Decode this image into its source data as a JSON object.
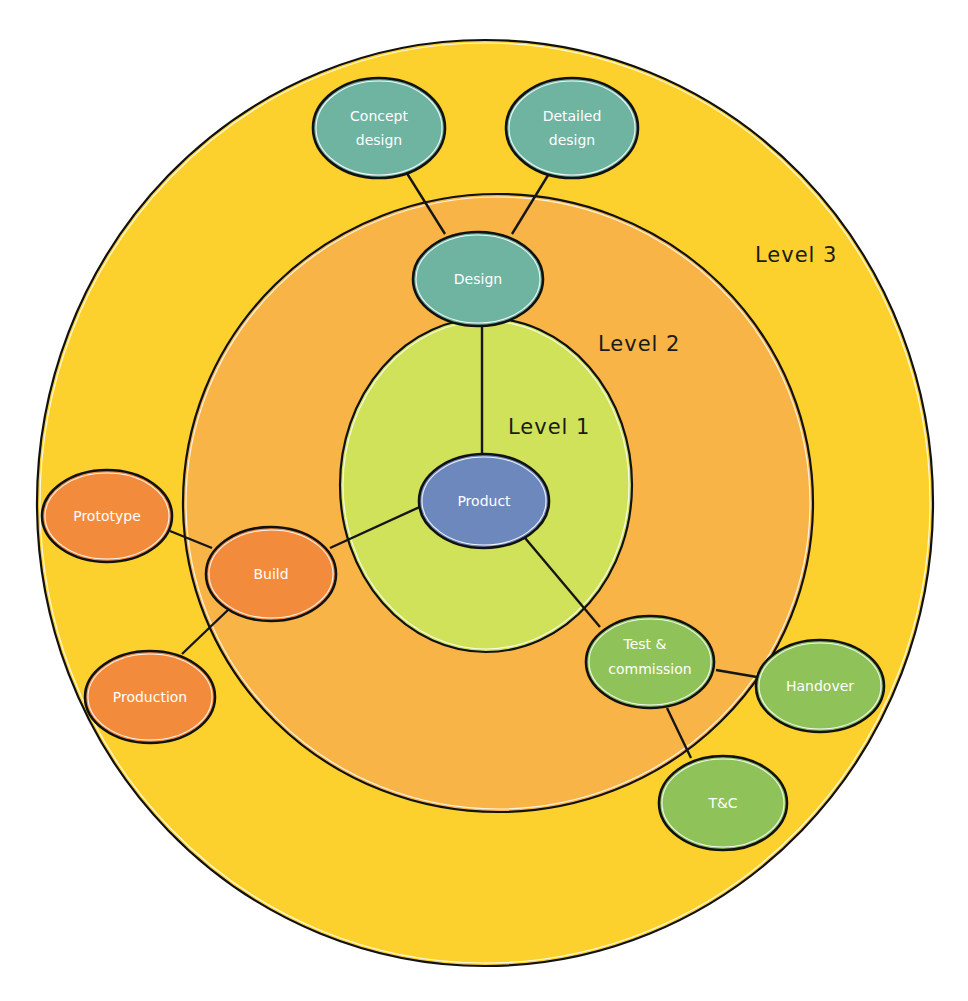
{
  "diagram": {
    "colors": {
      "background": "#ffffff",
      "level3_fill": "#fcd12e",
      "level2_fill": "#f8b446",
      "level1_fill": "#cfe25a",
      "outline": "#111111",
      "teal_node": "#6fb3a1",
      "orange_node": "#f38b3c",
      "green_node": "#8fc35a",
      "blue_node": "#6d88bd",
      "label_text": "#ffffff"
    },
    "levels": [
      {
        "id": "level3",
        "label": "Level 3"
      },
      {
        "id": "level2",
        "label": "Level 2"
      },
      {
        "id": "level1",
        "label": "Level 1"
      }
    ],
    "nodes": {
      "product": {
        "lines": [
          "Product"
        ]
      },
      "design": {
        "lines": [
          "Design"
        ]
      },
      "concept_design": {
        "lines": [
          "Concept",
          "design"
        ]
      },
      "detailed_design": {
        "lines": [
          "Detailed",
          "design"
        ]
      },
      "build": {
        "lines": [
          "Build"
        ]
      },
      "prototype": {
        "lines": [
          "Prototype"
        ]
      },
      "production": {
        "lines": [
          "Production"
        ]
      },
      "test_commission": {
        "lines": [
          "Test &",
          "commission"
        ]
      },
      "handover": {
        "lines": [
          "Handover"
        ]
      },
      "tc": {
        "lines": [
          "T&C"
        ]
      }
    },
    "edges": [
      {
        "from": "Product",
        "to": "Design"
      },
      {
        "from": "Product",
        "to": "Build"
      },
      {
        "from": "Product",
        "to": "Test & commission"
      },
      {
        "from": "Design",
        "to": "Concept design"
      },
      {
        "from": "Design",
        "to": "Detailed design"
      },
      {
        "from": "Build",
        "to": "Prototype"
      },
      {
        "from": "Build",
        "to": "Production"
      },
      {
        "from": "Test & commission",
        "to": "Handover"
      },
      {
        "from": "Test & commission",
        "to": "T&C"
      }
    ]
  }
}
